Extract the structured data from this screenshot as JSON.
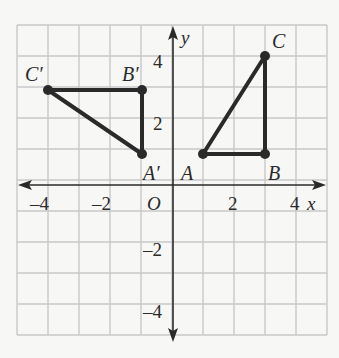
{
  "figure": {
    "type": "coordinate-plane",
    "x_axis_label": "x",
    "y_axis_label": "y",
    "origin_label": "O",
    "x_range": [
      -5,
      5
    ],
    "y_range": [
      -5,
      5
    ],
    "grid_step": 1,
    "x_tick_labels": [
      "–4",
      "–2",
      "2",
      "4"
    ],
    "y_tick_labels": [
      "4",
      "2",
      "–2",
      "–4"
    ],
    "colors": {
      "background": "#f7f7f5",
      "grid": "#c8c8c8",
      "axis": "#2a2a2a",
      "shape": "#2a2a2a"
    }
  },
  "triangles": [
    {
      "name": "ABC",
      "vertices": [
        {
          "label": "A",
          "x": 1,
          "y": 1
        },
        {
          "label": "B",
          "x": 3,
          "y": 1
        },
        {
          "label": "C",
          "x": 3,
          "y": 4
        }
      ]
    },
    {
      "name": "A'B'C'",
      "vertices": [
        {
          "label": "A′",
          "x": -1,
          "y": 1
        },
        {
          "label": "B′",
          "x": -1,
          "y": 3
        },
        {
          "label": "C′",
          "x": -4,
          "y": 3
        }
      ]
    }
  ]
}
